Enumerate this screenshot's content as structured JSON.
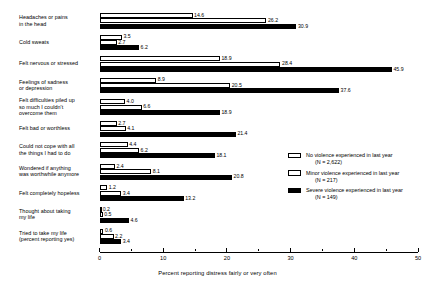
{
  "chart_data": {
    "type": "bar",
    "orientation": "horizontal",
    "title": "",
    "xlabel": "Percent reporting distress fairly or very often",
    "ylabel": "",
    "xlim": [
      0,
      50
    ],
    "xticks": [
      0,
      10,
      20,
      30,
      40,
      50
    ],
    "xtick_labels": [
      "0",
      "10",
      "20",
      "30",
      "40",
      "50"
    ],
    "minor_xticks": [
      5,
      15,
      25,
      35,
      45
    ],
    "grid": false,
    "legend_position": "right-middle",
    "categories": [
      "Headaches or pains\nin the head",
      "Cold sweats",
      "Felt nervous or stressed",
      "Feelings of sadness\nor depression",
      "Felt difficulties piled up\nso much I couldn't\novercome them",
      "Felt bad or worthless",
      "Could not cope with all\nthe things I had to do",
      "Wondered if anything\nwas worthwhile anymore",
      "Felt completely hopeless",
      "Thought about taking\nmy life",
      "Tried to take my life\n(percent reporting yes)"
    ],
    "series": [
      {
        "name": "No violence experienced in last year",
        "n_label": "(N = 2,622)",
        "swatch": "light",
        "values": [
          14.6,
          3.5,
          18.9,
          8.9,
          4.0,
          2.7,
          4.4,
          2.4,
          1.2,
          0.2,
          0.6
        ]
      },
      {
        "name": "Minor violence experienced in last year",
        "n_label": "(N = 217)",
        "swatch": "light",
        "values": [
          26.2,
          2.7,
          28.4,
          20.5,
          6.6,
          4.1,
          6.2,
          8.1,
          3.4,
          0.5,
          2.2
        ]
      },
      {
        "name": "Severe violence experienced in last year",
        "n_label": "(N = 149)",
        "swatch": "dark",
        "values": [
          30.9,
          6.2,
          45.9,
          37.6,
          18.9,
          21.4,
          18.1,
          20.8,
          13.2,
          4.6,
          3.4
        ]
      }
    ]
  }
}
